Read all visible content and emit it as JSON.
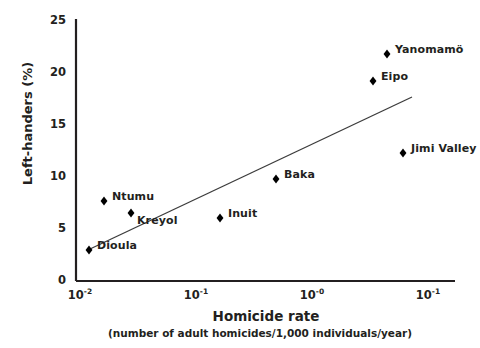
{
  "chart_data": {
    "type": "scatter",
    "title": "",
    "xlabel": "Homicide rate",
    "xsublabel": "(number of adult homicides/1,000 individuals/year)",
    "ylabel": "Left-handers (%)",
    "xscale": "log",
    "yscale": "linear",
    "ylim": [
      0,
      25
    ],
    "yticks": [
      0,
      5,
      10,
      15,
      20,
      25
    ],
    "ytick_labels": [
      "0",
      "5",
      "10",
      "15",
      "20",
      "25"
    ],
    "xtick_labels": [
      "10-2",
      "10-1",
      "10-0",
      "10-1"
    ],
    "xtick_bases": [
      "10",
      "10",
      "10",
      "10"
    ],
    "xtick_exponents": [
      "-2",
      "-1",
      "-0",
      "-1"
    ],
    "grid": false,
    "legend": null,
    "marker": "diamond",
    "marker_color": "#000000",
    "trendline": {
      "present": true,
      "color": "#3c3c3c",
      "x_start_px": 90,
      "y_start_px": 249,
      "x_end_px": 412,
      "y_end_px": 97
    },
    "points": [
      {
        "label": "Dioula",
        "y": 3.0,
        "x_px": 89,
        "y_px": 250,
        "label_dx": 8,
        "label_dy": -6
      },
      {
        "label": "Ntumu",
        "y": 7.7,
        "x_px": 104,
        "y_px": 201,
        "label_dx": 8,
        "label_dy": -6
      },
      {
        "label": "Kreyol",
        "y": 6.5,
        "x_px": 131,
        "y_px": 213,
        "label_dx": 6,
        "label_dy": 6
      },
      {
        "label": "Inuit",
        "y": 6.0,
        "x_px": 220,
        "y_px": 218,
        "label_dx": 8,
        "label_dy": -6
      },
      {
        "label": "Baka",
        "y": 9.8,
        "x_px": 276,
        "y_px": 179,
        "label_dx": 8,
        "label_dy": -6
      },
      {
        "label": "Jimi Valley",
        "y": 12.3,
        "x_px": 403,
        "y_px": 153,
        "label_dx": 8,
        "label_dy": -6
      },
      {
        "label": "Eipo",
        "y": 19.2,
        "x_px": 373,
        "y_px": 81,
        "label_dx": 8,
        "label_dy": -6
      },
      {
        "label": "Yanomamö",
        "y": 21.8,
        "x_px": 387,
        "y_px": 54,
        "label_dx": 8,
        "label_dy": -6
      }
    ]
  }
}
